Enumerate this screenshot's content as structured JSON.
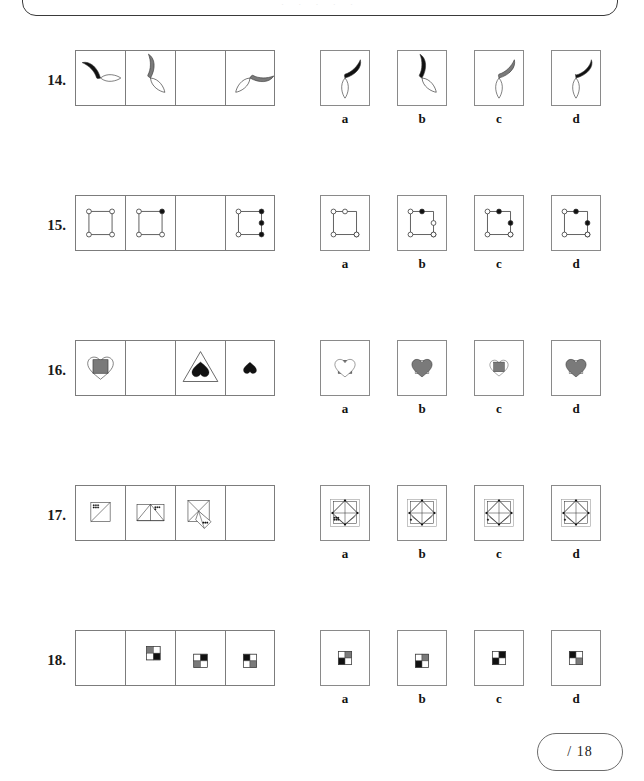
{
  "sheet": {
    "top_panel_ghost_text": "· · · · ·",
    "score_label": "/ 18",
    "option_labels": [
      "a",
      "b",
      "c",
      "d"
    ],
    "colors": {
      "black": "#111111",
      "gray": "#7a7a7a",
      "white": "#ffffff",
      "outline": "#333333",
      "cell_border": "#7c7c7c",
      "pill_border": "#6d6d6d"
    }
  },
  "questions": [
    {
      "number": "14.",
      "type": "crescent-and-leaf rotation",
      "stem": [
        {
          "shape": "crescent-leaf",
          "crescent_fill": "black",
          "rotation": 0,
          "empty": false
        },
        {
          "shape": "crescent-leaf",
          "crescent_fill": "gray",
          "rotation": 45,
          "empty": false
        },
        {
          "shape": "blank",
          "empty": true
        },
        {
          "shape": "crescent-leaf",
          "crescent_fill": "gray",
          "rotation": 135,
          "empty": false
        }
      ],
      "options": [
        {
          "label": "a",
          "shape": "crescent-leaf",
          "crescent_fill": "black",
          "rotation": 90
        },
        {
          "label": "b",
          "shape": "crescent-leaf",
          "crescent_fill": "black",
          "rotation": 45
        },
        {
          "label": "c",
          "shape": "crescent-leaf",
          "crescent_fill": "gray",
          "rotation": 90
        },
        {
          "label": "d",
          "shape": "crescent-leaf-wide",
          "crescent_fill": "black",
          "rotation": 90
        }
      ]
    },
    {
      "number": "15.",
      "type": "square with four corner dots",
      "stem": [
        {
          "shape": "dot-square",
          "dots": [
            "open",
            "open",
            "open",
            "open"
          ],
          "extra_dot": null,
          "empty": false
        },
        {
          "shape": "dot-square",
          "dots": [
            "open",
            "filled",
            "open",
            "open"
          ],
          "extra_dot": null,
          "empty": false
        },
        {
          "shape": "blank",
          "empty": true
        },
        {
          "shape": "dot-square",
          "dots": [
            "open",
            "filled",
            "filled",
            "open"
          ],
          "extra_dot": "right-mid-filled",
          "empty": false
        }
      ],
      "options": [
        {
          "label": "a",
          "dots": [
            "open",
            "open",
            "open",
            "open"
          ],
          "extra_dot": null,
          "top_dot_centered": true
        },
        {
          "label": "b",
          "dots": [
            "open",
            "filled",
            "open",
            "open"
          ],
          "extra_dot": "right-mid-open",
          "top_dot_centered": true
        },
        {
          "label": "c",
          "dots": [
            "open",
            "filled",
            "open",
            "open"
          ],
          "extra_dot": "right-mid-filled",
          "top_dot_centered": true
        },
        {
          "label": "d",
          "dots": [
            "open",
            "filled",
            "filled",
            "open"
          ],
          "extra_dot": "right-mid-filled",
          "top_dot_centered": true
        }
      ]
    },
    {
      "number": "16.",
      "type": "heart and square overlay",
      "stem": [
        {
          "shape": "heart-square",
          "heart_fill": "white",
          "square_fill": "gray",
          "square_on_top": true,
          "size": "large",
          "empty": false
        },
        {
          "shape": "blank",
          "empty": true
        },
        {
          "shape": "triangle-heart",
          "heart_fill": "black",
          "triangle_fill": "white",
          "empty": false
        },
        {
          "shape": "heart-small",
          "heart_fill": "black",
          "empty": false
        }
      ],
      "options": [
        {
          "label": "a",
          "heart_fill": "white",
          "square_fill": "gray",
          "square_on_top": false
        },
        {
          "label": "b",
          "heart_fill": "gray",
          "square_fill": "white",
          "square_on_top": false
        },
        {
          "label": "c",
          "heart_fill": "white",
          "square_fill": "gray",
          "square_on_top": true,
          "size": "small"
        },
        {
          "label": "d",
          "heart_fill": "gray",
          "square_fill": "white",
          "square_on_top": false,
          "size": "medium"
        }
      ]
    },
    {
      "number": "17.",
      "type": "folded triangle accumulation with dot cluster",
      "stem": [
        {
          "shape": "fold-1",
          "dots": 6,
          "empty": false
        },
        {
          "shape": "fold-2",
          "dots": 4,
          "empty": false
        },
        {
          "shape": "fold-3",
          "dots": 3,
          "empty": false
        },
        {
          "shape": "blank",
          "empty": true
        }
      ],
      "options": [
        {
          "label": "a",
          "shape": "fold-full",
          "dots": 6
        },
        {
          "label": "b",
          "shape": "fold-full",
          "dots": 1
        },
        {
          "label": "c",
          "shape": "fold-full",
          "dots": 1
        },
        {
          "label": "d",
          "shape": "fold-full",
          "dots": 1
        }
      ]
    },
    {
      "number": "18.",
      "type": "2x2 quadrant block rotation",
      "stem": [
        {
          "shape": "blank",
          "empty": true
        },
        {
          "quads": [
            "gray",
            "white",
            "white",
            "black"
          ],
          "offset": "up",
          "empty": false
        },
        {
          "quads": [
            "white",
            "black",
            "gray",
            "white"
          ],
          "offset": "down",
          "empty": false
        },
        {
          "quads": [
            "black",
            "white",
            "white",
            "gray"
          ],
          "offset": "down",
          "empty": false
        }
      ],
      "options": [
        {
          "label": "a",
          "quads": [
            "white",
            "gray",
            "black",
            "white"
          ]
        },
        {
          "label": "b",
          "quads": [
            "white",
            "gray",
            "black",
            "white"
          ],
          "offset": "down"
        },
        {
          "label": "c",
          "quads": [
            "white",
            "black",
            "black",
            "white"
          ]
        },
        {
          "label": "d",
          "quads": [
            "black",
            "white",
            "white",
            "gray"
          ]
        }
      ]
    }
  ]
}
